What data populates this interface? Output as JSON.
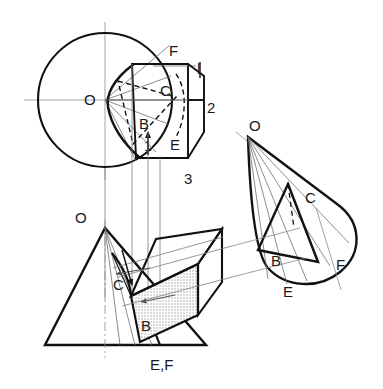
{
  "drawing": {
    "title": "Orthographic and pictorial views of a cone cut by a plane",
    "background_color": "#ffffff",
    "ink_color": "#111111",
    "thin_color": "#7a7a7a",
    "hatch_color": "#9a9a9a",
    "shade_fill": "#e3e3e3"
  },
  "views": {
    "top": {
      "name": "top-view",
      "center_label": "O",
      "circle": {
        "cx": 105,
        "cy": 100,
        "r": 67
      },
      "labels": [
        {
          "key": "O",
          "text": "O",
          "x": 84,
          "y": 105
        },
        {
          "key": "F",
          "text": "F",
          "x": 169,
          "y": 56
        },
        {
          "key": "C",
          "text": "C",
          "x": 160,
          "y": 96
        },
        {
          "key": "B",
          "text": "B",
          "x": 139,
          "y": 129
        },
        {
          "key": "E",
          "text": "E",
          "x": 170,
          "y": 150
        },
        {
          "key": "one",
          "text": "1",
          "x": 148,
          "y": 149
        }
      ]
    },
    "aux": {
      "name": "auxiliary-view-box",
      "labels": [
        {
          "key": "one",
          "text": "l",
          "x": 200,
          "y": 74
        },
        {
          "key": "two",
          "text": "2",
          "x": 209,
          "y": 113
        },
        {
          "key": "three",
          "text": "3",
          "x": 188,
          "y": 182
        }
      ]
    },
    "front": {
      "name": "front-view",
      "labels": [
        {
          "key": "O",
          "text": "O",
          "x": 80,
          "y": 221
        },
        {
          "key": "C",
          "text": "C",
          "x": 118,
          "y": 287
        },
        {
          "key": "B",
          "text": "B",
          "x": 146,
          "y": 327
        },
        {
          "key": "EF",
          "text": "E,F",
          "x": 157,
          "y": 370
        }
      ]
    },
    "pictorial": {
      "name": "pictorial-view",
      "labels": [
        {
          "key": "O",
          "text": "O",
          "x": 254,
          "y": 128
        },
        {
          "key": "C",
          "text": "C",
          "x": 311,
          "y": 199
        },
        {
          "key": "B",
          "text": "B",
          "x": 276,
          "y": 262
        },
        {
          "key": "E",
          "text": "E",
          "x": 288,
          "y": 292
        },
        {
          "key": "F",
          "text": "F",
          "x": 340,
          "y": 266
        }
      ]
    }
  }
}
